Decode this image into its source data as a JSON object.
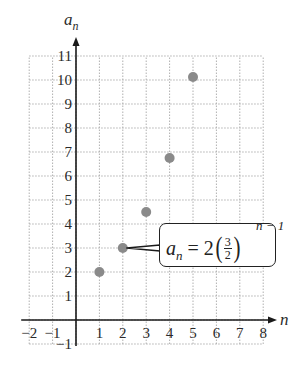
{
  "chart_data": {
    "type": "scatter",
    "title": "",
    "xlabel": "n",
    "ylabel": "a_n",
    "xlim": [
      -2,
      8
    ],
    "ylim": [
      -1,
      11
    ],
    "grid": true,
    "x_ticks": [
      "−2",
      "−1",
      "1",
      "2",
      "3",
      "4",
      "5",
      "6",
      "7",
      "8"
    ],
    "y_ticks": [
      "−1",
      "1",
      "2",
      "3",
      "4",
      "5",
      "6",
      "7",
      "8",
      "9",
      "10",
      "11"
    ],
    "series": [
      {
        "name": "a_n = 2(3/2)^(n−1)",
        "x": [
          1,
          2,
          3,
          4,
          5
        ],
        "y": [
          2,
          3,
          4.5,
          6.75,
          10.125
        ],
        "color": "#8a8a8a"
      }
    ],
    "annotations": [
      {
        "type": "callout",
        "points_to": [
          2,
          3
        ],
        "text": "a_n = 2(3/2)^(n − 1)"
      }
    ]
  },
  "labels": {
    "y_axis": "a",
    "y_axis_sub": "n",
    "x_axis": "n"
  },
  "callout": {
    "lhs": "a",
    "lhs_sub": "n",
    "equals": "=",
    "coef": "2",
    "lparen": "(",
    "rparen": ")",
    "frac_num": "3",
    "frac_den": "2",
    "exponent": "n − 1"
  },
  "colors": {
    "axis": "#1a1a1a",
    "grid": "#b0b0b0",
    "point": "#8a8a8a"
  }
}
